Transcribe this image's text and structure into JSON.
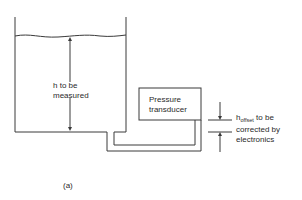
{
  "diagram": {
    "tank_label_line1": "h to be",
    "tank_label_line2": "measured",
    "transducer_line1": "Pressure",
    "transducer_line2": "transducer",
    "offset_symbol": "h",
    "offset_subscript": "offset",
    "offset_line1_rest": " to be",
    "offset_line2": "corrected by",
    "offset_line3": "electronics",
    "caption": "(a)",
    "stroke_color": "#3a3a3a"
  }
}
